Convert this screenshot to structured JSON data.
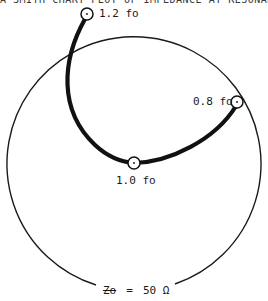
{
  "figure": {
    "caption_clipped": "A SMITH CHART PLOT OF IMPEDANCE AT RESONANCE FREQUENCY",
    "characteristic_impedance": {
      "symbol": "Zo",
      "equals": "=",
      "value": "50 Ω"
    },
    "points": [
      {
        "id": "p12",
        "label": "1.2 fo"
      },
      {
        "id": "p10",
        "label": "1.0 fo"
      },
      {
        "id": "p08",
        "label": "0.8 fo"
      }
    ],
    "colors": {
      "line": "#111111",
      "circle": "#1a1a1a",
      "background": "#ffffff"
    }
  }
}
